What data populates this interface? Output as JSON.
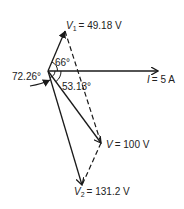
{
  "diagram": {
    "type": "phasor",
    "origin": [
      48,
      71
    ],
    "phasors": [
      {
        "id": "V1",
        "label_sym": "V",
        "label_sub": "1",
        "label_value": "= 49.18 V",
        "tip": [
          65,
          31
        ],
        "style": "solid"
      },
      {
        "id": "I",
        "label_sym": "I",
        "label_sub": "",
        "label_value": "= 5 A",
        "tip": [
          158,
          71
        ],
        "style": "solid"
      },
      {
        "id": "V",
        "label_sym": "V",
        "label_sub": "",
        "label_value": "= 100 V",
        "tip": [
          101,
          143
        ],
        "style": "solid"
      },
      {
        "id": "V2",
        "label_sym": "V",
        "label_sub": "2",
        "label_value": "= 131.2 V",
        "tip": [
          82,
          185
        ],
        "style": "solid"
      }
    ],
    "dashed_lines": [
      {
        "from": "V1",
        "to": "V"
      },
      {
        "from": "V",
        "to": "V2"
      }
    ],
    "angles": [
      {
        "label": "66°",
        "between": [
          "V1",
          "I"
        ]
      },
      {
        "label": "53.13°",
        "between": [
          "I",
          "V"
        ]
      },
      {
        "label": "72.26°",
        "between": [
          "I",
          "V2"
        ]
      }
    ],
    "line_color": "#1a1a1a"
  }
}
